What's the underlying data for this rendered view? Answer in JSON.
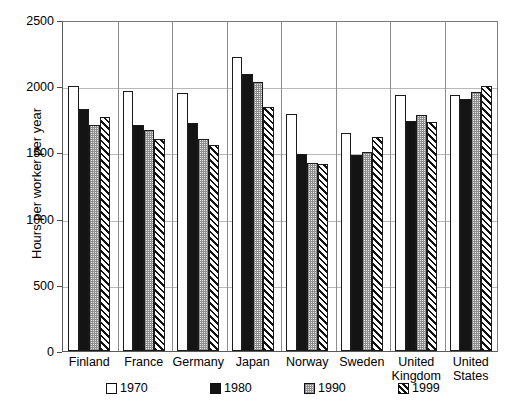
{
  "chart_data": {
    "type": "bar",
    "title": "",
    "xlabel": "",
    "ylabel": "Hours per worker per year",
    "ylim": [
      0,
      2500
    ],
    "yticks": [
      0,
      500,
      1000,
      1500,
      2000,
      2500
    ],
    "ytick_labels": [
      "0",
      "500",
      "1000",
      "1500",
      "2000",
      "2500"
    ],
    "grid": true,
    "legend_position": "bottom",
    "categories": [
      "Finland",
      "France",
      "Germany",
      "Japan",
      "Norway",
      "Sweden",
      "United Kingdom",
      "United States"
    ],
    "category_lines": [
      [
        "Finland"
      ],
      [
        "France"
      ],
      [
        "Germany"
      ],
      [
        "Japan"
      ],
      [
        "Norway"
      ],
      [
        "Sweden"
      ],
      [
        "United",
        "Kingdom"
      ],
      [
        "United",
        "States"
      ]
    ],
    "series": [
      {
        "name": "1970",
        "fill": "white",
        "values": [
          2000,
          1965,
          1945,
          2220,
          1790,
          1645,
          1935,
          1935
        ]
      },
      {
        "name": "1980",
        "fill": "black",
        "values": [
          1825,
          1710,
          1725,
          2090,
          1490,
          1480,
          1735,
          1905
        ]
      },
      {
        "name": "1990",
        "fill": "light-gray-dotted",
        "values": [
          1705,
          1670,
          1605,
          2030,
          1420,
          1505,
          1780,
          1960
        ]
      },
      {
        "name": "1999",
        "fill": "diagonal-hatch",
        "values": [
          1770,
          1600,
          1555,
          1840,
          1410,
          1620,
          1730,
          2000
        ]
      }
    ],
    "colors": {
      "series_1970": "#ffffff",
      "series_1980": "#141414",
      "series_1990": "#e8e8e8",
      "series_1999": "#111111",
      "axis": "#5a5a5a",
      "gridline": "#b9b9b9",
      "background": "#ffffff"
    }
  },
  "legend": {
    "items": [
      {
        "label": "1970"
      },
      {
        "label": "1980"
      },
      {
        "label": "1990"
      },
      {
        "label": "1999"
      }
    ]
  }
}
